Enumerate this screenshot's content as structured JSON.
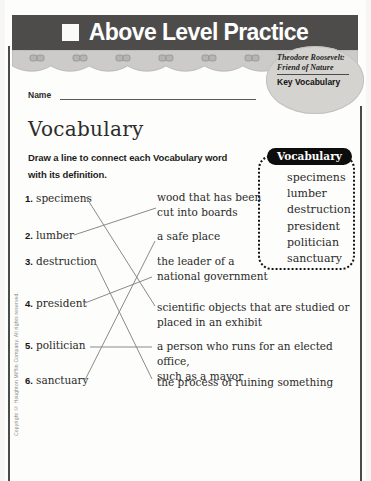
{
  "header": {
    "title": "Above Level Practice"
  },
  "badge": {
    "book_title_line1": "Theodore Roosevelt:",
    "book_title_line2": "Friend of Nature",
    "section_label": "Key Vocabulary"
  },
  "name_field": {
    "label": "Name",
    "value": ""
  },
  "page_title": "Vocabulary",
  "instruction": {
    "line1": "Draw a line to connect each Vocabulary word",
    "line2": "with its definition."
  },
  "vocab_box": {
    "label": "Vocabulary",
    "words": [
      "specimens",
      "lumber",
      "destruction",
      "president",
      "politician",
      "sanctuary"
    ]
  },
  "exercise": {
    "terms": [
      {
        "num": "1.",
        "word": "specimens"
      },
      {
        "num": "2.",
        "word": "lumber"
      },
      {
        "num": "3.",
        "word": "destruction"
      },
      {
        "num": "4.",
        "word": "president"
      },
      {
        "num": "5.",
        "word": "politician"
      },
      {
        "num": "6.",
        "word": "sanctuary"
      }
    ],
    "definitions": [
      {
        "line1": "wood that has been",
        "line2": "cut into boards"
      },
      {
        "line1": "a safe place",
        "line2": ""
      },
      {
        "line1": "the leader of a",
        "line2": "national government"
      },
      {
        "line1": "scientific objects that are studied or",
        "line2": "placed in an exhibit"
      },
      {
        "line1": "a person who runs for an elected office,",
        "line2": "such as a mayor"
      },
      {
        "line1": "the process of ruining something",
        "line2": ""
      }
    ],
    "connections": [
      {
        "term": "specimens",
        "definition": "scientific objects that are studied or placed in an exhibit",
        "x1": 86,
        "y1": 197,
        "x2": 155,
        "y2": 306
      },
      {
        "term": "lumber",
        "definition": "wood that has been cut into boards",
        "x1": 74,
        "y1": 235,
        "x2": 156,
        "y2": 208
      },
      {
        "term": "destruction",
        "definition": "the process of ruining something",
        "x1": 96,
        "y1": 264,
        "x2": 152,
        "y2": 379
      },
      {
        "term": "president",
        "definition": "the leader of a national government",
        "x1": 85,
        "y1": 303,
        "x2": 152,
        "y2": 277
      },
      {
        "term": "politician",
        "definition": "a person who runs for an elected office, such as a mayor",
        "x1": 90,
        "y1": 347,
        "x2": 152,
        "y2": 347
      },
      {
        "term": "sanctuary",
        "definition": "a safe place",
        "x1": 85,
        "y1": 380,
        "x2": 155,
        "y2": 241
      }
    ]
  },
  "footer": {
    "copyright": "Copyright © Houghton Mifflin Company. All rights reserved."
  },
  "colors": {
    "banner_bg": "#4d4c4b",
    "banner_text": "#ffffff",
    "band_bg": "#cccbc9",
    "badge_bg": "#d4d3d0",
    "pill_bg": "#0d0d0d",
    "connection_line": "#8a8a8a"
  }
}
